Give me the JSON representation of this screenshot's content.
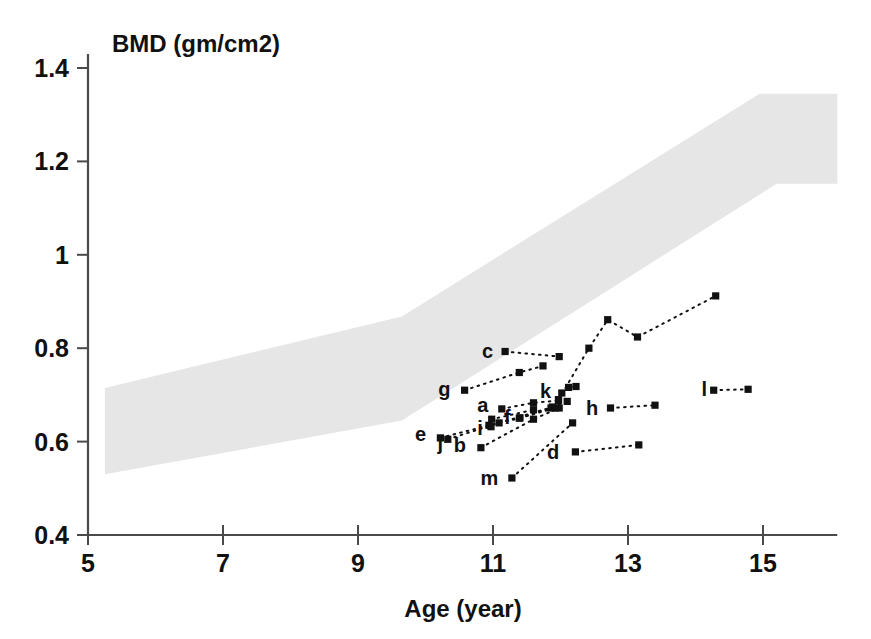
{
  "chart_data": {
    "type": "scatter",
    "title": "",
    "xlabel": "Age (year)",
    "ylabel": "BMD (gm/cm2)",
    "xlim": [
      5,
      16.1
    ],
    "ylim": [
      0.4,
      1.43
    ],
    "xticks": [
      5,
      7,
      9,
      11,
      13,
      15
    ],
    "xticklabels": [
      "5",
      "7",
      "9",
      "11",
      "13",
      "15"
    ],
    "yticks": [
      0.4,
      0.6,
      0.8,
      1.0,
      1.2,
      1.4
    ],
    "yticklabels": [
      "0.4",
      "0.6",
      "0.8",
      "1",
      "1.2",
      "1.4"
    ],
    "grid": false,
    "legend": "none",
    "reference_band": {
      "name": "normal-reference-range",
      "color": "#e6e6e6",
      "upper": [
        [
          5.25,
          0.715
        ],
        [
          9.65,
          0.868
        ],
        [
          14.95,
          1.345
        ],
        [
          16.1,
          1.345
        ]
      ],
      "lower": [
        [
          5.25,
          0.53
        ],
        [
          9.65,
          0.645
        ],
        [
          15.2,
          1.152
        ],
        [
          16.1,
          1.152
        ]
      ]
    },
    "series": [
      {
        "name": "a",
        "label": "a",
        "label_xy": [
          10.93,
          0.678
        ],
        "points": [
          [
            11.13,
            0.67
          ],
          [
            11.6,
            0.683
          ],
          [
            11.97,
            0.688
          ]
        ]
      },
      {
        "name": "b",
        "label": "b",
        "label_xy": [
          10.6,
          0.592
        ],
        "points": [
          [
            10.82,
            0.587
          ],
          [
            11.6,
            0.648
          ],
          [
            11.98,
            0.672
          ]
        ]
      },
      {
        "name": "c",
        "label": "c",
        "label_xy": [
          11.0,
          0.795
        ],
        "points": [
          [
            11.18,
            0.793
          ],
          [
            11.98,
            0.782
          ]
        ]
      },
      {
        "name": "d",
        "label": "d",
        "label_xy": [
          11.98,
          0.578
        ],
        "points": [
          [
            12.22,
            0.578
          ],
          [
            13.16,
            0.593
          ]
        ]
      },
      {
        "name": "e",
        "label": "e",
        "label_xy": [
          10.01,
          0.617
        ],
        "points": [
          [
            10.22,
            0.608
          ],
          [
            10.94,
            0.635
          ],
          [
            11.39,
            0.65
          ],
          [
            11.92,
            0.672
          ]
        ]
      },
      {
        "name": "f",
        "label": "f",
        "label_xy": [
          11.26,
          0.653
        ],
        "points": [
          [
            11.4,
            0.651
          ],
          [
            11.86,
            0.672
          ],
          [
            12.1,
            0.686
          ]
        ]
      },
      {
        "name": "g",
        "label": "g",
        "label_xy": [
          10.37,
          0.712
        ],
        "points": [
          [
            10.58,
            0.71
          ],
          [
            11.39,
            0.748
          ],
          [
            11.74,
            0.762
          ]
        ]
      },
      {
        "name": "h",
        "label": "h",
        "label_xy": [
          12.56,
          0.672
        ],
        "points": [
          [
            12.74,
            0.672
          ],
          [
            13.4,
            0.678
          ]
        ]
      },
      {
        "name": "i",
        "label": "i",
        "label_xy": [
          10.85,
          0.63
        ],
        "points": [
          [
            10.97,
            0.632
          ],
          [
            10.98,
            0.648
          ],
          [
            11.6,
            0.668
          ]
        ]
      },
      {
        "name": "j",
        "label": "j",
        "label_xy": [
          10.26,
          0.597
        ],
        "points": [
          [
            10.33,
            0.605
          ],
          [
            11.09,
            0.64
          ],
          [
            11.88,
            0.674
          ]
        ]
      },
      {
        "name": "k",
        "label": "k",
        "label_xy": [
          11.86,
          0.708
        ],
        "points": [
          [
            12.02,
            0.704
          ],
          [
            12.12,
            0.716
          ],
          [
            12.23,
            0.718
          ]
        ]
      },
      {
        "name": "l",
        "label": "l",
        "label_xy": [
          14.17,
          0.712
        ],
        "points": [
          [
            14.27,
            0.71
          ],
          [
            14.78,
            0.712
          ]
        ]
      },
      {
        "name": "m",
        "label": "m",
        "label_xy": [
          11.08,
          0.523
        ],
        "points": [
          [
            11.28,
            0.522
          ],
          [
            12.18,
            0.64
          ]
        ]
      },
      {
        "name": "rising",
        "label": "",
        "label_xy": null,
        "points": [
          [
            11.97,
            0.69
          ],
          [
            12.42,
            0.8
          ],
          [
            12.7,
            0.861
          ],
          [
            13.14,
            0.824
          ],
          [
            14.3,
            0.912
          ]
        ]
      }
    ]
  },
  "axes": {
    "y_axis_title": "BMD (gm/cm2)",
    "x_axis_title": "Age (year)"
  }
}
